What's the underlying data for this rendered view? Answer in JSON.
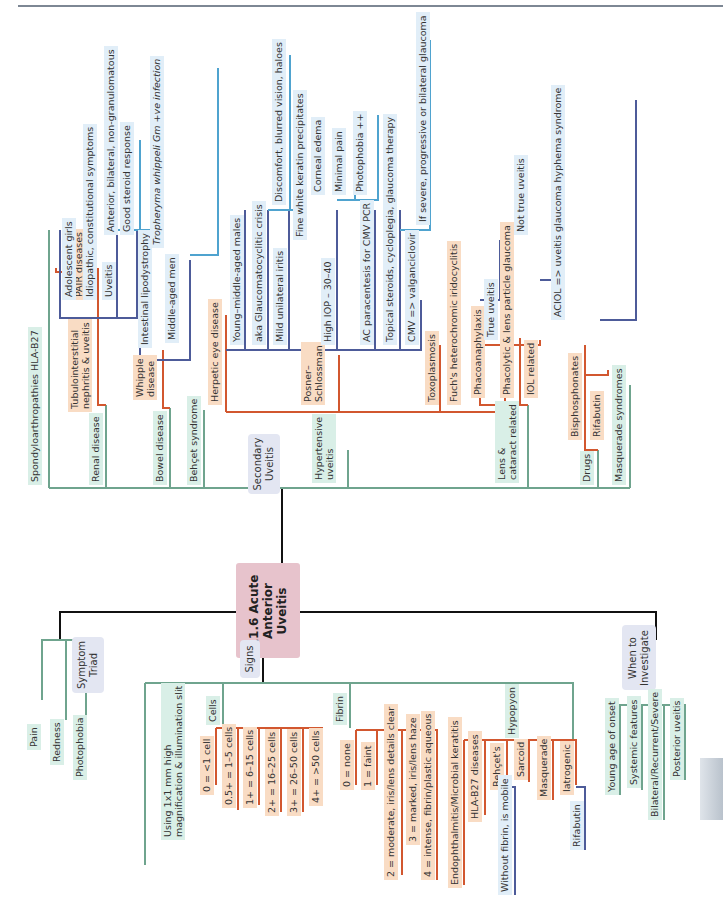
{
  "page": {
    "side_tab_color": "#c5ccd4"
  },
  "colors": {
    "green": "#6fa48e",
    "orange": "#d2572f",
    "blue": "#4d5b99",
    "lightblue": "#4fa3cf",
    "black": "#111111",
    "central": "#e7c3cc"
  },
  "central": {
    "title": "11.6 Acute\nAnterior\nUveitis"
  },
  "branches": {
    "secondary": "Secondary\nUveitis",
    "symptom": "Symptom\nTriad",
    "signs": "Signs",
    "investigate": "When to\nInvestigate"
  },
  "secondary": {
    "spondylo": "Spondyloarthropathies HLA-B27",
    "renal": "Renal disease",
    "pair": "PAIR diseases",
    "tinu": "Tubulointerstitial\nnephritis & uveitis",
    "adolescent": "Adolescent girls",
    "idiopathic": "Idiopathic, constitutional symptoms",
    "uveitis": "Uveitis",
    "anterior": "Anterior, bilateral, non-granulomatous",
    "steroid": "Good steroid response",
    "bowel": "Bowel disease",
    "whipple": "Whipple\ndisease",
    "lipodystrophy": "Intestinal lipodystrophy",
    "tropheryma": "Tropheryma whippeli Gm +ve infection",
    "middleaged": "Middle-aged men",
    "behcet": "Behçet syndrome",
    "herpetic": "Herpetic eye disease",
    "hypertensive": "Hypertensive\nuveitis",
    "posner": "Posner–\nSchlossman",
    "young": "Young–middle-aged males",
    "aka": "aka Glaucomatocyclitic crisis",
    "discomfort": "Discomfort, blurred vision, haloes",
    "mild": "Mild unilateral iritis",
    "fine": "Fine white keratin precipitates",
    "highiop": "High IOP – 30–40",
    "corneal": "Corneal edema",
    "minimal": "Minimal pain",
    "photophobia": "Photophobia ++",
    "ac": "AC paracentesis for CMV PCR",
    "topical": "Topical steroids, cycloplegia, glaucoma therapy",
    "cmv": "CMV => valganciclovir",
    "severe": "If severe, progressive or bilateral glaucoma",
    "toxo": "Toxoplasmosis",
    "fuchs": "Fuch's heterochromic iridocyclitis",
    "lens": "Lens &\ncataract related",
    "phaco": "Phacoanaphylaxis",
    "true": "True uveitis",
    "phacolytic": "Phacolytic & lens particle glaucoma",
    "nottrue": "Not true uveitis",
    "iol": "IOL related",
    "aciol": "ACIOL => uveitis glaucoma hyphema syndrome",
    "drugs": "Drugs",
    "bisphos": "Bisphosphonates",
    "rifabutin": "Rifabutin",
    "masquerade": "Masquerade syndromes"
  },
  "symptoms": [
    "Pain",
    "Redness",
    "Photophobia"
  ],
  "signs": {
    "using": "Using 1x1 mm high\nmagnification & illumination slit",
    "cells": "Cells",
    "cell_grades": [
      "0 = <1 cell",
      "0.5+ = 1–5 cells",
      "1+ = 6–15 cells",
      "2+ = 16–25 cells",
      "3+ = 26–50 cells",
      "4+ = >50 cells"
    ],
    "fibrin": "Fibrin",
    "fibrin_grades": [
      "0 = none",
      "1 = faint",
      "2 = moderate, iris/lens details clear",
      "3 = marked, iris/lens haze",
      "4 = intense, fibrin/plastic aqueous"
    ],
    "hypopyon": "Hypopyon",
    "hypopyon_causes": [
      "Endophthalmitis/Microbial keratitis",
      "HLA-B27 diseases",
      "Behçet's",
      "Sarcoid",
      "Masquerade",
      "Iatrogenic"
    ],
    "mobile": "Without fibrin, is mobile",
    "rifabutin": "Rifabutin"
  },
  "investigate": [
    "Young age of onset",
    "Systemic features",
    "Bilateral/Recurrent/Severe",
    "Posterior uveitis"
  ]
}
